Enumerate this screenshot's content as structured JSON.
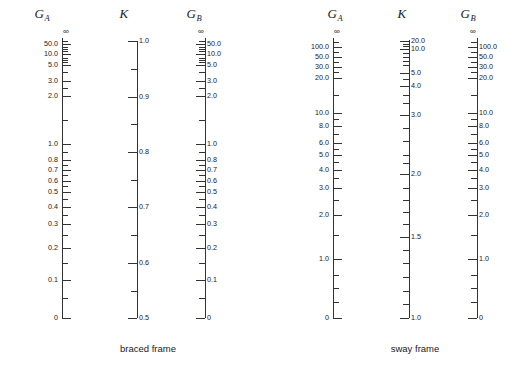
{
  "figure": {
    "type": "nomograph",
    "background_color": "#ffffff",
    "line_color": "#333333",
    "text_color": "#1a1a1a"
  },
  "panels": [
    {
      "id": "braced",
      "caption": "braced frame",
      "scales": [
        {
          "id": "braced-ga",
          "name": "G_A",
          "title_main": "G",
          "title_sub": "A",
          "label_side": "left",
          "top_symbol": "∞",
          "axis_top_px": 38,
          "axis_bottom_px": 318,
          "major": [
            {
              "label": "50.0",
              "y": 44
            },
            {
              "label": "10.0",
              "y": 54
            },
            {
              "label": "5.0",
              "y": 65
            },
            {
              "label": "3.0",
              "y": 81
            },
            {
              "label": "2.0",
              "y": 96
            },
            {
              "label": "1.0",
              "y": 144
            },
            {
              "label": "0.8",
              "y": 160
            },
            {
              "label": "0.7",
              "y": 170
            },
            {
              "label": "0.6",
              "y": 181
            },
            {
              "label": "0.5",
              "y": 192
            },
            {
              "label": "0.4",
              "y": 207
            },
            {
              "label": "0.3",
              "y": 224
            },
            {
              "label": "0.2",
              "y": 248
            },
            {
              "label": "0.1",
              "y": 280
            },
            {
              "label": "0",
              "y": 318
            }
          ],
          "minor": [
            41,
            47,
            49,
            51,
            58,
            60,
            62,
            72,
            88,
            120,
            152,
            165,
            175,
            186,
            199,
            215,
            235,
            263,
            298
          ]
        },
        {
          "id": "braced-k",
          "name": "K",
          "title_main": "K",
          "title_sub": "",
          "label_side": "right",
          "top_symbol": "",
          "axis_top_px": 41,
          "axis_bottom_px": 318,
          "major": [
            {
              "label": "1.0",
              "y": 41
            },
            {
              "label": "0.9",
              "y": 97
            },
            {
              "label": "0.8",
              "y": 152
            },
            {
              "label": "0.7",
              "y": 207
            },
            {
              "label": "0.6",
              "y": 263
            },
            {
              "label": "0.5",
              "y": 318
            }
          ],
          "minor": [
            69,
            124,
            180,
            235,
            291
          ]
        },
        {
          "id": "braced-gb",
          "name": "G_B",
          "title_main": "G",
          "title_sub": "B",
          "label_side": "right",
          "top_symbol": "∞",
          "axis_top_px": 38,
          "axis_bottom_px": 318,
          "major": [
            {
              "label": "50.0",
              "y": 44
            },
            {
              "label": "10.0",
              "y": 54
            },
            {
              "label": "5.0",
              "y": 65
            },
            {
              "label": "3.0",
              "y": 81
            },
            {
              "label": "2.0",
              "y": 96
            },
            {
              "label": "1.0",
              "y": 144
            },
            {
              "label": "0.8",
              "y": 160
            },
            {
              "label": "0.7",
              "y": 170
            },
            {
              "label": "0.6",
              "y": 181
            },
            {
              "label": "0.5",
              "y": 192
            },
            {
              "label": "0.4",
              "y": 207
            },
            {
              "label": "0.3",
              "y": 224
            },
            {
              "label": "0.2",
              "y": 248
            },
            {
              "label": "0.1",
              "y": 280
            },
            {
              "label": "0",
              "y": 318
            }
          ],
          "minor": [
            41,
            47,
            49,
            51,
            58,
            60,
            62,
            72,
            88,
            120,
            152,
            165,
            175,
            186,
            199,
            215,
            235,
            263,
            298
          ]
        }
      ]
    },
    {
      "id": "sway",
      "caption": "sway frame",
      "scales": [
        {
          "id": "sway-ga",
          "name": "G_A",
          "title_main": "G",
          "title_sub": "A",
          "label_side": "left",
          "top_symbol": "∞",
          "axis_top_px": 38,
          "axis_bottom_px": 318,
          "major": [
            {
              "label": "100.0",
              "y": 47
            },
            {
              "label": "50.0",
              "y": 57
            },
            {
              "label": "30.0",
              "y": 67
            },
            {
              "label": "20.0",
              "y": 78
            },
            {
              "label": "10.0",
              "y": 113
            },
            {
              "label": "8.0",
              "y": 126
            },
            {
              "label": "6.0",
              "y": 143
            },
            {
              "label": "5.0",
              "y": 155
            },
            {
              "label": "4.0",
              "y": 170
            },
            {
              "label": "3.0",
              "y": 188
            },
            {
              "label": "2.0",
              "y": 215
            },
            {
              "label": "1.0",
              "y": 259
            },
            {
              "label": "0",
              "y": 318
            }
          ],
          "minor": [
            42,
            52,
            62,
            72,
            95,
            119,
            134,
            149,
            162,
            178,
            200,
            235,
            275,
            288,
            302
          ]
        },
        {
          "id": "sway-k",
          "name": "K",
          "title_main": "K",
          "title_sub": "",
          "label_side": "right",
          "top_symbol": "",
          "axis_top_px": 40,
          "axis_bottom_px": 318,
          "major": [
            {
              "label": "20.0",
              "y": 41
            },
            {
              "label": "10.0",
              "y": 49
            },
            {
              "label": "5.0",
              "y": 73
            },
            {
              "label": "4.0",
              "y": 86
            },
            {
              "label": "3.0",
              "y": 115
            },
            {
              "label": "2.0",
              "y": 174
            },
            {
              "label": "1.5",
              "y": 237
            },
            {
              "label": "1.0",
              "y": 318
            }
          ],
          "minor": [
            44,
            46,
            53,
            57,
            61,
            65,
            79,
            95,
            103,
            128,
            141,
            155,
            163,
            188,
            200,
            212,
            224,
            250,
            263,
            277,
            291,
            304
          ]
        },
        {
          "id": "sway-gb",
          "name": "G_B",
          "title_main": "G",
          "title_sub": "B",
          "label_side": "right",
          "top_symbol": "∞",
          "axis_top_px": 38,
          "axis_bottom_px": 318,
          "major": [
            {
              "label": "100.0",
              "y": 47
            },
            {
              "label": "50.0",
              "y": 57
            },
            {
              "label": "30.0",
              "y": 67
            },
            {
              "label": "20.0",
              "y": 78
            },
            {
              "label": "10.0",
              "y": 113
            },
            {
              "label": "8.0",
              "y": 126
            },
            {
              "label": "6.0",
              "y": 143
            },
            {
              "label": "5.0",
              "y": 155
            },
            {
              "label": "4.0",
              "y": 170
            },
            {
              "label": "3.0",
              "y": 188
            },
            {
              "label": "2.0",
              "y": 215
            },
            {
              "label": "1.0",
              "y": 259
            },
            {
              "label": "0",
              "y": 318
            }
          ],
          "minor": [
            42,
            52,
            62,
            72,
            95,
            119,
            134,
            149,
            162,
            178,
            200,
            235,
            275,
            288,
            302
          ]
        }
      ]
    }
  ],
  "chart_data": {
    "type": "table",
    "braced_frame": {
      "caption": "braced frame",
      "GA_scale": {
        "labels": [
          "∞",
          "50.0",
          "10.0",
          "5.0",
          "3.0",
          "2.0",
          "1.0",
          "0.8",
          "0.7",
          "0.6",
          "0.5",
          "0.4",
          "0.3",
          "0.2",
          "0.1",
          "0"
        ]
      },
      "K_scale": {
        "labels": [
          "1.0",
          "0.9",
          "0.8",
          "0.7",
          "0.6",
          "0.5"
        ],
        "range": [
          0.5,
          1.0
        ]
      },
      "GB_scale": {
        "labels": [
          "∞",
          "50.0",
          "10.0",
          "5.0",
          "3.0",
          "2.0",
          "1.0",
          "0.8",
          "0.7",
          "0.6",
          "0.5",
          "0.4",
          "0.3",
          "0.2",
          "0.1",
          "0"
        ]
      }
    },
    "sway_frame": {
      "caption": "sway frame",
      "GA_scale": {
        "labels": [
          "∞",
          "100.0",
          "50.0",
          "30.0",
          "20.0",
          "10.0",
          "8.0",
          "6.0",
          "5.0",
          "4.0",
          "3.0",
          "2.0",
          "1.0",
          "0"
        ]
      },
      "K_scale": {
        "labels": [
          "20.0",
          "10.0",
          "5.0",
          "4.0",
          "3.0",
          "2.0",
          "1.5",
          "1.0"
        ],
        "range": [
          1.0,
          20.0
        ]
      },
      "GB_scale": {
        "labels": [
          "∞",
          "100.0",
          "50.0",
          "30.0",
          "20.0",
          "10.0",
          "8.0",
          "6.0",
          "5.0",
          "4.0",
          "3.0",
          "2.0",
          "1.0",
          "0"
        ]
      }
    }
  },
  "captions": {
    "braced": "braced frame",
    "sway": "sway frame"
  }
}
